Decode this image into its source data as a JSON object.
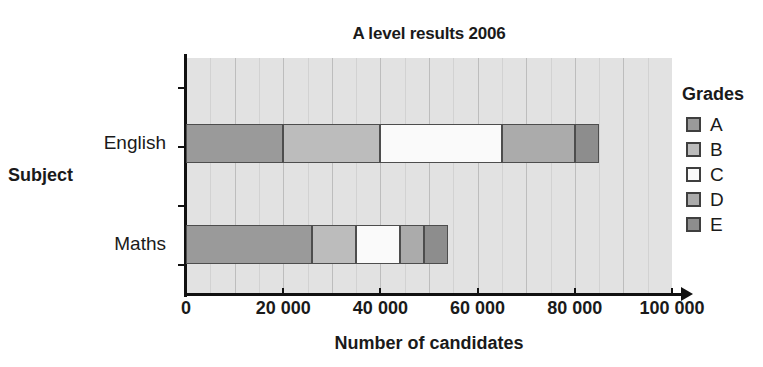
{
  "chart_data": {
    "type": "bar",
    "orientation": "horizontal",
    "stacked": true,
    "title": "A level results 2006",
    "xlabel": "Number of candidates",
    "ylabel": "Subject",
    "categories": [
      "English",
      "Maths"
    ],
    "xlim": [
      0,
      100000
    ],
    "xticks": [
      0,
      20000,
      40000,
      60000,
      80000,
      100000
    ],
    "xtick_labels": [
      "0",
      "20 000",
      "40 000",
      "60 000",
      "80 000",
      "100 000"
    ],
    "grid": "vertical-minor-every-5000",
    "legend_title": "Grades",
    "legend_position": "right",
    "series": [
      {
        "name": "A",
        "color": "#9a9a9a",
        "values": [
          20000,
          26000
        ]
      },
      {
        "name": "B",
        "color": "#bcbcbc",
        "values": [
          20000,
          9000
        ]
      },
      {
        "name": "C",
        "color": "#fafafa",
        "values": [
          25000,
          9000
        ]
      },
      {
        "name": "D",
        "color": "#ababab",
        "values": [
          15000,
          5000
        ]
      },
      {
        "name": "E",
        "color": "#8d8d8d",
        "values": [
          5000,
          5000
        ]
      }
    ],
    "totals": [
      85000,
      54000
    ],
    "segments": {
      "English": [
        {
          "grade": "A",
          "start": 0,
          "end": 20000
        },
        {
          "grade": "B",
          "start": 20000,
          "end": 40000
        },
        {
          "grade": "C",
          "start": 40000,
          "end": 65000
        },
        {
          "grade": "D",
          "start": 65000,
          "end": 80000
        },
        {
          "grade": "E",
          "start": 80000,
          "end": 85000
        }
      ],
      "Maths": [
        {
          "grade": "A",
          "start": 0,
          "end": 26000
        },
        {
          "grade": "B",
          "start": 26000,
          "end": 35000
        },
        {
          "grade": "C",
          "start": 35000,
          "end": 44000
        },
        {
          "grade": "D",
          "start": 44000,
          "end": 49000
        },
        {
          "grade": "E",
          "start": 49000,
          "end": 54000
        }
      ]
    },
    "colors": {
      "plot_background": "#e2e2e2",
      "gridline_minor": "#d2d2d2",
      "gridline_major": "#bdbdbd",
      "axis": "#111111",
      "bar_outline": "#4d4d4d",
      "text": "#1a1a1a"
    }
  },
  "legend": {
    "title": "Grades",
    "items": [
      {
        "label": "A",
        "color": "#9a9a9a"
      },
      {
        "label": "B",
        "color": "#bcbcbc"
      },
      {
        "label": "C",
        "color": "#fafafa"
      },
      {
        "label": "D",
        "color": "#ababab"
      },
      {
        "label": "E",
        "color": "#8d8d8d"
      }
    ]
  }
}
